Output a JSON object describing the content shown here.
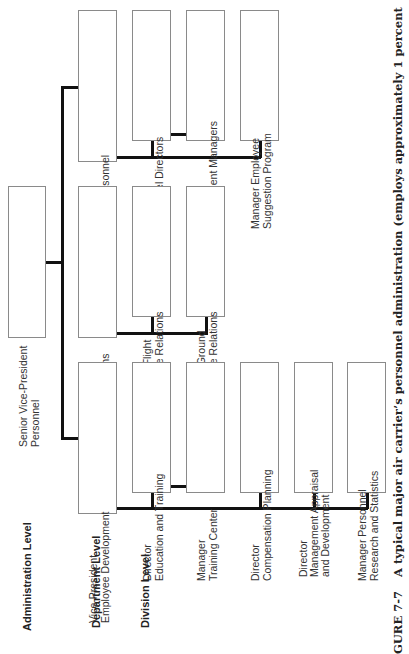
{
  "levels": {
    "administration": "Administration Level",
    "department": "Department Level",
    "division": "Division Level"
  },
  "nodes": {
    "senior_vp": "Senior Vice-President\nPersonnel",
    "vp_employee_development": "Vice-President\nEmployee Development",
    "vp_employee_relations": "Vice-President\nEmployee Relations",
    "director_field_services": "Director\nField Services Personnel",
    "director_education_training": "Director\nEducation and Training",
    "manager_training_center": "Manager\nTraining Center",
    "director_compensation": "Director\nCompensation Planning",
    "director_management_appraisal": "Director\nManagement Appraisal\nand Development",
    "manager_personnel_research": "Manager Personnel\nResearch and Statistics",
    "director_flight_er": "Director Flight\nEmployee Relations",
    "director_ground_er": "Director Ground\nEmployee Relations",
    "regional_personnel_directors": "Regional\nPersonnel Directors",
    "regional_employment_managers": "Regional\nEmployment Managers",
    "manager_suggestion_program": "Manager Employee\nSuggestion Program"
  },
  "caption": {
    "figure": "GURE 7-7",
    "text": "A typical major air carrier’s personnel administration (employs approximately 1 percent"
  },
  "colors": {
    "line": "#111111",
    "box_border": "#8a8a8a",
    "text": "#333333"
  }
}
